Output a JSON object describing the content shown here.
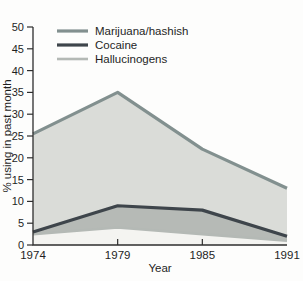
{
  "chart_data": {
    "type": "area",
    "categories": [
      "1974",
      "1979",
      "1985",
      "1991"
    ],
    "series": [
      {
        "name": "Marijuana/hashish",
        "values": [
          25.5,
          35,
          22,
          13
        ],
        "line_color": "#82908f",
        "fill_color": "#dadcd8"
      },
      {
        "name": "Cocaine",
        "values": [
          3,
          9,
          8,
          2
        ],
        "line_color": "#3e454b",
        "fill_color": "#b6bab6"
      },
      {
        "name": "Hallucinogens",
        "values": [
          2.5,
          4,
          2.5,
          1
        ],
        "line_color": "#b4b9b5",
        "fill_color": "#f4f4f1"
      }
    ],
    "title": "",
    "xlabel": "Year",
    "ylabel": "% using in past month",
    "ylim": [
      0,
      50
    ],
    "yticks": [
      0,
      5,
      10,
      15,
      20,
      25,
      30,
      35,
      40,
      45,
      50
    ],
    "xticks_inner": [
      "1979",
      "1985"
    ],
    "grid": false,
    "legend_position": "top-left",
    "axis_color": "#2e2e2e",
    "text_color": "#1f1f1f"
  }
}
